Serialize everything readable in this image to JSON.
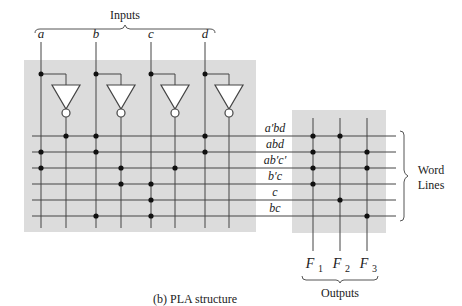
{
  "title": "Inputs",
  "caption": "(b)  PLA structure",
  "inputs": [
    {
      "name": "a",
      "x": 41
    },
    {
      "name": "b",
      "x": 96
    },
    {
      "name": "c",
      "x": 151
    },
    {
      "name": "d",
      "x": 205
    }
  ],
  "inverter_outputs_x": [
    66,
    121,
    175,
    229
  ],
  "word_lines": [
    {
      "label": "a′bd",
      "y": 136,
      "and_dots_x": [
        66,
        96,
        205
      ],
      "or_dots": [
        0,
        1
      ]
    },
    {
      "label": "abd",
      "y": 152,
      "and_dots_x": [
        41,
        96,
        205
      ],
      "or_dots": [
        0,
        2
      ]
    },
    {
      "label": "ab′c′",
      "y": 168,
      "and_dots_x": [
        41,
        121,
        175
      ],
      "or_dots": [
        0,
        2
      ]
    },
    {
      "label": "b′c",
      "y": 184,
      "and_dots_x": [
        121,
        151
      ],
      "or_dots": [
        0
      ]
    },
    {
      "label": "c",
      "y": 200,
      "and_dots_x": [
        151
      ],
      "or_dots": [
        1
      ]
    },
    {
      "label": "bc",
      "y": 216,
      "and_dots_x": [
        96,
        151
      ],
      "or_dots": [
        2
      ]
    }
  ],
  "outputs": [
    {
      "name": "F",
      "sub": "1",
      "x": 313
    },
    {
      "name": "F",
      "sub": "2",
      "x": 340
    },
    {
      "name": "F",
      "sub": "3",
      "x": 367
    }
  ],
  "outputs_label": "Outputs",
  "word_lines_label": [
    "Word",
    "Lines"
  ],
  "colors": {
    "plane": "#dcdcdc",
    "wire": "#444444",
    "dot": "#111111"
  }
}
